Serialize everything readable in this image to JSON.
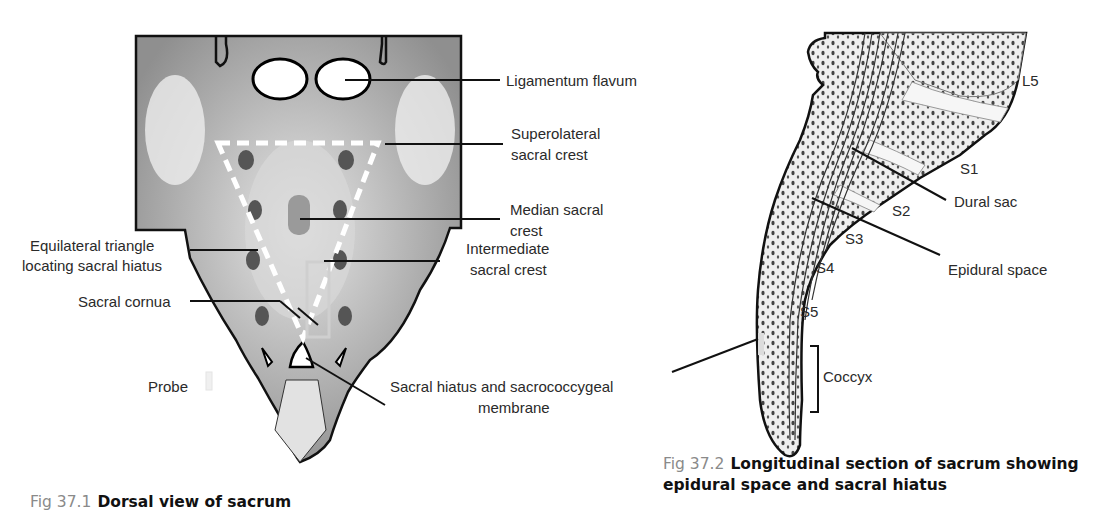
{
  "figure1": {
    "caption_number": "Fig 37.1",
    "caption_title": "Dorsal view of sacrum",
    "labels": {
      "ligamentum_flavum": "Ligamentum flavum",
      "superolateral_line1": "Superolateral",
      "superolateral_line2": "sacral crest",
      "median_line1": "Median sacral",
      "median_line2": "crest",
      "intermediate_line1": "Intermediate",
      "intermediate_line2": "sacral crest",
      "triangle_line1": "Equilateral triangle",
      "triangle_line2": "locating sacral hiatus",
      "sacral_cornua": "Sacral cornua",
      "probe": "Probe",
      "hiatus_line1": "Sacral hiatus and sacrococcygeal",
      "hiatus_line2": "membrane"
    }
  },
  "figure2": {
    "caption_number": "Fig 37.2",
    "caption_title_line1": "Longitudinal section of sacrum showing",
    "caption_title_line2": "epidural space and sacral hiatus",
    "labels": {
      "l5": "L5",
      "s1": "S1",
      "s2": "S2",
      "s3": "S3",
      "s4": "S4",
      "s5": "S5",
      "dural_sac": "Dural sac",
      "epidural_space": "Epidural space",
      "coccyx": "Coccyx"
    }
  }
}
